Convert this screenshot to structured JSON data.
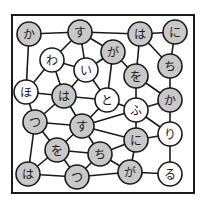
{
  "puzzle": {
    "type": "hiragana-node-graph",
    "colors": {
      "shaded": "#c8c8c8",
      "unshaded": "#ffffff",
      "line": "#1a1a1a"
    },
    "frame": {
      "x": 12,
      "y": 15,
      "w": 182,
      "h": 178
    },
    "node_radius": 12,
    "nodes": [
      {
        "id": "n1",
        "char": "か",
        "x": 29,
        "y": 34,
        "shaded": true
      },
      {
        "id": "n2",
        "char": "す",
        "x": 80,
        "y": 32,
        "shaded": true
      },
      {
        "id": "n3",
        "char": "は",
        "x": 140,
        "y": 34,
        "shaded": true
      },
      {
        "id": "n4",
        "char": "に",
        "x": 175,
        "y": 32,
        "shaded": true
      },
      {
        "id": "n5",
        "char": "わ",
        "x": 52,
        "y": 60,
        "shaded": false
      },
      {
        "id": "n6",
        "char": "い",
        "x": 86,
        "y": 70,
        "shaded": false
      },
      {
        "id": "n7",
        "char": "が",
        "x": 113,
        "y": 52,
        "shaded": true
      },
      {
        "id": "n8",
        "char": "を",
        "x": 136,
        "y": 76,
        "shaded": true
      },
      {
        "id": "n9",
        "char": "ち",
        "x": 170,
        "y": 66,
        "shaded": true
      },
      {
        "id": "n10",
        "char": "ほ",
        "x": 26,
        "y": 92,
        "shaded": false
      },
      {
        "id": "n11",
        "char": "は",
        "x": 64,
        "y": 96,
        "shaded": true
      },
      {
        "id": "n12",
        "char": "と",
        "x": 107,
        "y": 100,
        "shaded": false
      },
      {
        "id": "n13",
        "char": "ふ",
        "x": 136,
        "y": 110,
        "shaded": false
      },
      {
        "id": "n14",
        "char": "か",
        "x": 170,
        "y": 100,
        "shaded": true
      },
      {
        "id": "n15",
        "char": "つ",
        "x": 35,
        "y": 122,
        "shaded": true
      },
      {
        "id": "n16",
        "char": "す",
        "x": 82,
        "y": 126,
        "shaded": true
      },
      {
        "id": "n17",
        "char": "に",
        "x": 136,
        "y": 140,
        "shaded": true
      },
      {
        "id": "n18",
        "char": "り",
        "x": 170,
        "y": 134,
        "shaded": false
      },
      {
        "id": "n19",
        "char": "を",
        "x": 57,
        "y": 150,
        "shaded": true
      },
      {
        "id": "n20",
        "char": "ち",
        "x": 100,
        "y": 154,
        "shaded": true
      },
      {
        "id": "n21",
        "char": "は",
        "x": 28,
        "y": 174,
        "shaded": true
      },
      {
        "id": "n22",
        "char": "つ",
        "x": 77,
        "y": 177,
        "shaded": true
      },
      {
        "id": "n23",
        "char": "が",
        "x": 130,
        "y": 172,
        "shaded": true
      },
      {
        "id": "n24",
        "char": "る",
        "x": 170,
        "y": 174,
        "shaded": false
      }
    ],
    "edges": [
      [
        "n1",
        "n2"
      ],
      [
        "n2",
        "n3"
      ],
      [
        "n3",
        "n4"
      ],
      [
        "n1",
        "n10"
      ],
      [
        "n2",
        "n5"
      ],
      [
        "n2",
        "n6"
      ],
      [
        "n2",
        "n7"
      ],
      [
        "n5",
        "n6"
      ],
      [
        "n5",
        "n10"
      ],
      [
        "n5",
        "n11"
      ],
      [
        "n6",
        "n7"
      ],
      [
        "n6",
        "n11"
      ],
      [
        "n6",
        "n12"
      ],
      [
        "n7",
        "n12"
      ],
      [
        "n7",
        "n8"
      ],
      [
        "n3",
        "n8"
      ],
      [
        "n3",
        "n9"
      ],
      [
        "n4",
        "n9"
      ],
      [
        "n8",
        "n13"
      ],
      [
        "n8",
        "n14"
      ],
      [
        "n9",
        "n14"
      ],
      [
        "n10",
        "n11"
      ],
      [
        "n10",
        "n15"
      ],
      [
        "n11",
        "n12"
      ],
      [
        "n11",
        "n16"
      ],
      [
        "n11",
        "n15"
      ],
      [
        "n12",
        "n13"
      ],
      [
        "n12",
        "n16"
      ],
      [
        "n13",
        "n16"
      ],
      [
        "n13",
        "n14"
      ],
      [
        "n13",
        "n17"
      ],
      [
        "n13",
        "n18"
      ],
      [
        "n14",
        "n18"
      ],
      [
        "n15",
        "n16"
      ],
      [
        "n15",
        "n19"
      ],
      [
        "n15",
        "n21"
      ],
      [
        "n16",
        "n19"
      ],
      [
        "n16",
        "n20"
      ],
      [
        "n16",
        "n17"
      ],
      [
        "n17",
        "n20"
      ],
      [
        "n17",
        "n23"
      ],
      [
        "n17",
        "n18"
      ],
      [
        "n18",
        "n24"
      ],
      [
        "n19",
        "n20"
      ],
      [
        "n19",
        "n21"
      ],
      [
        "n19",
        "n22"
      ],
      [
        "n20",
        "n22"
      ],
      [
        "n20",
        "n23"
      ],
      [
        "n21",
        "n22"
      ],
      [
        "n22",
        "n23"
      ],
      [
        "n23",
        "n24"
      ]
    ]
  }
}
